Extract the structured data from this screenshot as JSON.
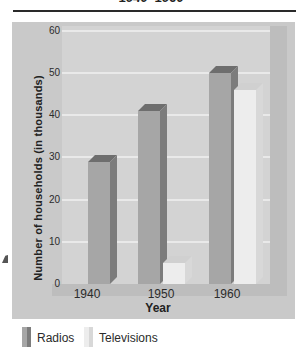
{
  "title": "1940–1960",
  "chart_data": {
    "type": "bar",
    "style": "3d-bars",
    "title": "1940–1960",
    "categories": [
      "1940",
      "1950",
      "1960"
    ],
    "series": [
      {
        "name": "Radios",
        "values": [
          29,
          41,
          50
        ]
      },
      {
        "name": "Televisions",
        "values": [
          0,
          5,
          46
        ]
      }
    ],
    "xlabel": "Year",
    "ylabel": "Number of households (in thousands)",
    "ylim": [
      0,
      60
    ],
    "yticks": [
      0,
      10,
      20,
      30,
      40,
      50,
      60
    ],
    "grid": true,
    "legend_position": "bottom",
    "colors": {
      "radios": {
        "front": "#a6a6a6",
        "side": "#7c7c7c",
        "top": "#6e6e6e"
      },
      "televisions": {
        "front": "#ededed",
        "side": "#d8d8d8",
        "top": "#d0d0d0"
      },
      "panel_bg": "#c9c9c9",
      "plot_bg": "#d3d3d3",
      "wall": "#bdbdbd",
      "gridline": "#e9e9e9",
      "text": "#2b2b2b"
    }
  },
  "legend": {
    "items": [
      {
        "label": "Radios"
      },
      {
        "label": "Televisions"
      }
    ]
  }
}
